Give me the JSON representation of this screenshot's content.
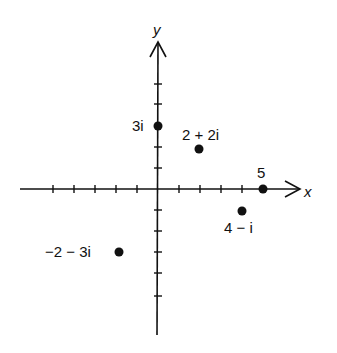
{
  "diagram": {
    "axes": {
      "x_label": "x",
      "y_label": "y",
      "origin_px": [
        158,
        189
      ],
      "unit_px": 21,
      "x_ticks": [
        -5,
        -4,
        -3,
        -2,
        -1,
        1,
        2,
        3,
        4,
        5
      ],
      "y_ticks": [
        3,
        2,
        1,
        -1,
        -2,
        -3,
        -4,
        -5
      ]
    },
    "points": [
      {
        "label": "3i",
        "re": 0,
        "im": 3
      },
      {
        "label": "2 + 2i",
        "re": 2,
        "im": 2
      },
      {
        "label": "5",
        "re": 5,
        "im": 0
      },
      {
        "label": "4 − i",
        "re": 4,
        "im": -1
      },
      {
        "label": "−2 − 3i",
        "re": -2,
        "im": -3
      }
    ],
    "colors": {
      "ink": "#111111",
      "background": "#ffffff"
    }
  }
}
